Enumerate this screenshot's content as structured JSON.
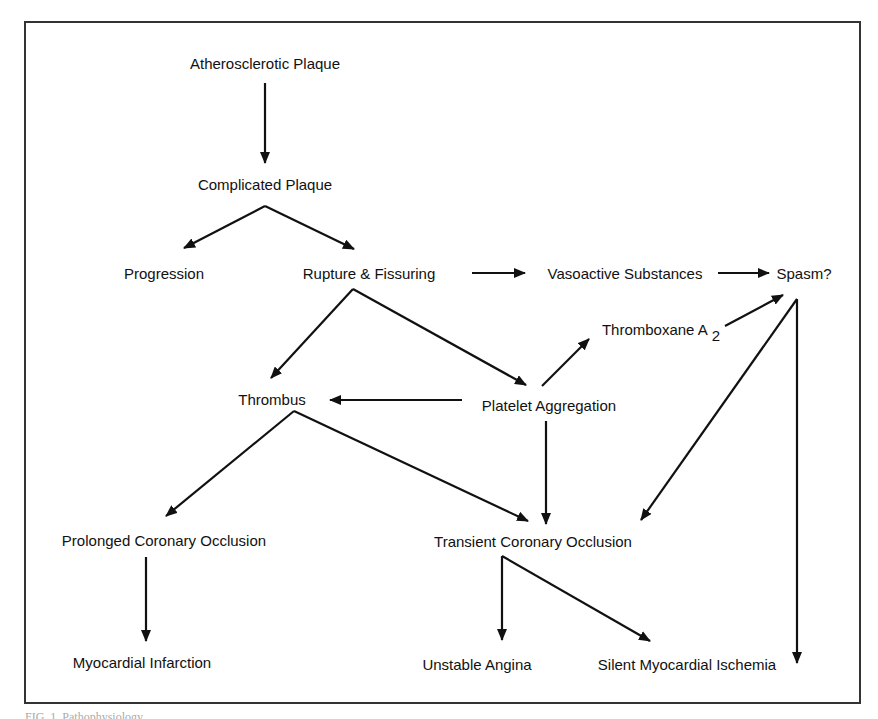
{
  "diagram": {
    "type": "flowchart",
    "nodes": {
      "atherosclerotic_plaque": "Atherosclerotic  Plaque",
      "complicated_plaque": "Complicated Plaque",
      "progression": "Progression",
      "rupture_fissuring": "Rupture  &  Fissuring",
      "vasoactive_substances": "Vasoactive Substances",
      "spasm": "Spasm?",
      "thromboxane": "Thromboxane A",
      "thromboxane_sub": "2",
      "thrombus": "Thrombus",
      "platelet_aggregation": "Platelet Aggregation",
      "prolonged_occlusion": "Prolonged Coronary Occlusion",
      "transient_occlusion": "Transient Coronary Occlusion",
      "myocardial_infarction": "Myocardial  Infarction",
      "unstable_angina": "Unstable Angina",
      "silent_ischemia": "Silent  Myocardial  Ischemia"
    },
    "edges": [
      {
        "from": "Atherosclerotic Plaque",
        "to": "Complicated Plaque"
      },
      {
        "from": "Complicated Plaque",
        "to": "Progression"
      },
      {
        "from": "Complicated Plaque",
        "to": "Rupture & Fissuring"
      },
      {
        "from": "Rupture & Fissuring",
        "to": "Vasoactive Substances"
      },
      {
        "from": "Vasoactive Substances",
        "to": "Spasm?"
      },
      {
        "from": "Rupture & Fissuring",
        "to": "Thrombus"
      },
      {
        "from": "Rupture & Fissuring",
        "to": "Platelet Aggregation"
      },
      {
        "from": "Platelet Aggregation",
        "to": "Thromboxane A2"
      },
      {
        "from": "Thromboxane A2",
        "to": "Spasm?"
      },
      {
        "from": "Platelet Aggregation",
        "to": "Thrombus"
      },
      {
        "from": "Platelet Aggregation",
        "to": "Transient Coronary Occlusion"
      },
      {
        "from": "Spasm?",
        "to": "Transient Coronary Occlusion"
      },
      {
        "from": "Spasm?",
        "to": "Silent Myocardial Ischemia"
      },
      {
        "from": "Thrombus",
        "to": "Prolonged Coronary Occlusion"
      },
      {
        "from": "Thrombus",
        "to": "Transient Coronary Occlusion"
      },
      {
        "from": "Prolonged Coronary Occlusion",
        "to": "Myocardial Infarction"
      },
      {
        "from": "Transient Coronary Occlusion",
        "to": "Unstable Angina"
      },
      {
        "from": "Transient Coronary Occlusion",
        "to": "Silent Myocardial Ischemia"
      }
    ]
  },
  "caption": {
    "text": "FIG. 1.  Pathophysiology"
  },
  "colors": {
    "ink": "#111111",
    "frame": "#333333",
    "background": "#ffffff"
  }
}
